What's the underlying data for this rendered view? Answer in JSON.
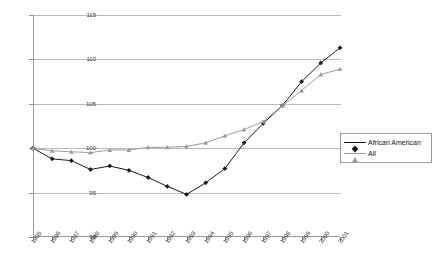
{
  "chart_data": {
    "type": "line",
    "title": "",
    "xlabel": "",
    "ylabel": "",
    "ylim": [
      90,
      115
    ],
    "yticks": [
      90,
      95,
      100,
      105,
      110,
      115
    ],
    "grid": true,
    "legend_position": "right",
    "categories": [
      "1985",
      "1986",
      "1987",
      "1988",
      "1989",
      "1990",
      "1991",
      "1992",
      "1993",
      "1994",
      "1995",
      "1996",
      "1997",
      "1998",
      "1999",
      "2000",
      "2001"
    ],
    "series": [
      {
        "name": "African American",
        "color": "#1a1a1a",
        "marker": "diamond",
        "values": [
          100.0,
          98.8,
          98.6,
          97.6,
          98.0,
          97.5,
          96.7,
          95.7,
          94.8,
          96.1,
          97.7,
          100.6,
          102.8,
          104.8,
          107.5,
          109.6,
          111.3
        ]
      },
      {
        "name": "All",
        "color": "#9b9b9b",
        "marker": "triangle",
        "values": [
          100.0,
          99.7,
          99.6,
          99.5,
          99.8,
          99.8,
          100.1,
          100.1,
          100.2,
          100.6,
          101.4,
          102.1,
          103.0,
          104.8,
          106.5,
          108.3,
          108.9
        ]
      }
    ]
  },
  "legend": {
    "items": [
      {
        "label": "African American"
      },
      {
        "label": "All"
      }
    ]
  }
}
